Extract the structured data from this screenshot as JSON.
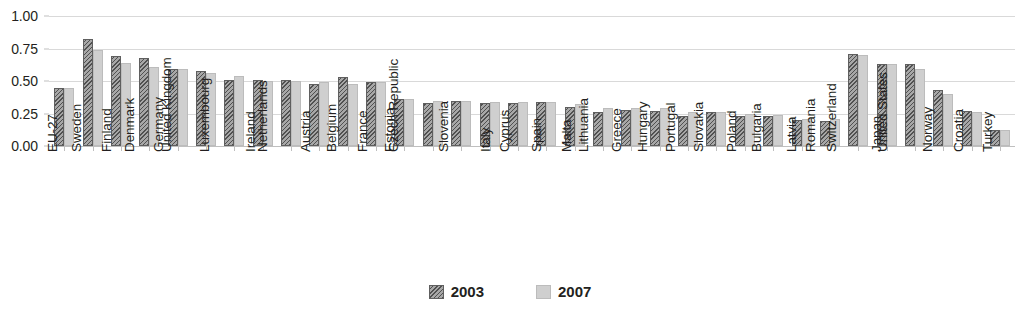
{
  "chart_data": {
    "type": "bar",
    "title": "",
    "xlabel": "",
    "ylabel": "",
    "ylim": [
      0,
      1.0
    ],
    "yticks": [
      "0.00",
      "0.25",
      "0.50",
      "0.75",
      "1.00"
    ],
    "ytick_values": [
      0.0,
      0.25,
      0.5,
      0.75,
      1.0
    ],
    "grid": true,
    "legend_position": "bottom-center",
    "categories": [
      "EU-27",
      "Sweden",
      "Finland",
      "Denmark",
      "Germany",
      "United Kingdom",
      "Luxembourg",
      "Ireland",
      "Netherlands",
      "Austria",
      "Belgium",
      "France",
      "Estonia",
      "Czech Republic",
      "Slovenia",
      "Italy",
      "Cyprus",
      "Spain",
      "Malta",
      "Lithuania",
      "Greece",
      "Hungary",
      "Portugal",
      "Slovakia",
      "Poland",
      "Bulgaria",
      "Latvia",
      "Romania",
      "Switzerland",
      "Japan",
      "United States",
      "Norway",
      "Croatia",
      "Turkey"
    ],
    "series": [
      {
        "name": "2003",
        "color": "#7a7a7a",
        "values": [
          0.45,
          0.82,
          0.69,
          0.68,
          0.59,
          0.58,
          0.51,
          0.51,
          0.51,
          0.48,
          0.53,
          0.49,
          0.36,
          0.33,
          0.35,
          0.33,
          0.33,
          0.34,
          0.3,
          0.26,
          0.28,
          0.27,
          0.23,
          0.26,
          0.23,
          0.23,
          0.2,
          0.19,
          0.71,
          0.63,
          0.63,
          0.43,
          0.27,
          0.12
        ]
      },
      {
        "name": "2007",
        "color": "#cfcfcf",
        "values": [
          0.45,
          0.74,
          0.64,
          0.61,
          0.59,
          0.56,
          0.54,
          0.5,
          0.5,
          0.49,
          0.48,
          0.49,
          0.36,
          0.35,
          0.35,
          0.34,
          0.34,
          0.34,
          0.32,
          0.29,
          0.29,
          0.29,
          0.26,
          0.26,
          0.25,
          0.24,
          0.21,
          0.21,
          0.7,
          0.63,
          0.59,
          0.4,
          0.26,
          0.12
        ]
      }
    ]
  },
  "legend": {
    "items": [
      {
        "label": "2003",
        "swatch": "hatched-dark-swatch"
      },
      {
        "label": "2007",
        "swatch": "light-gray-swatch"
      }
    ]
  }
}
